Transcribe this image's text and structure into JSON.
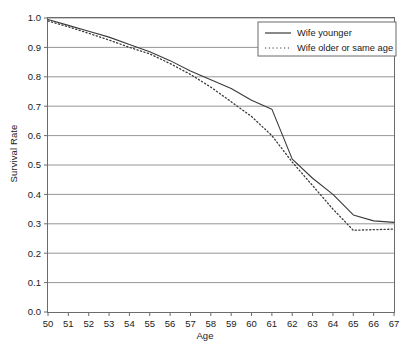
{
  "chart_data": {
    "type": "line",
    "title": "",
    "xlabel": "Age",
    "ylabel": "Survival Rate",
    "xlim": [
      50,
      67
    ],
    "ylim": [
      0.0,
      1.0
    ],
    "grid": true,
    "grid_axis": "y",
    "legend_position": "top-right",
    "x_ticks": [
      50,
      51,
      52,
      53,
      54,
      55,
      56,
      57,
      58,
      59,
      60,
      61,
      62,
      63,
      64,
      65,
      66,
      67
    ],
    "x_tick_labels": [
      "50",
      "51",
      "52",
      "53",
      "54",
      "55",
      "56",
      "57",
      "58",
      "59",
      "60",
      "61",
      "62",
      "63",
      "64",
      "65",
      "66",
      "67"
    ],
    "y_ticks": [
      0.0,
      0.1,
      0.2,
      0.3,
      0.4,
      0.5,
      0.6,
      0.7,
      0.8,
      0.9,
      1.0
    ],
    "y_tick_labels": [
      "0.0",
      "0.1",
      "0.2",
      "0.3",
      "0.4",
      "0.5",
      "0.6",
      "0.7",
      "0.8",
      "0.9",
      "1.0"
    ],
    "x": [
      50,
      51,
      52,
      53,
      54,
      55,
      56,
      57,
      58,
      59,
      60,
      61,
      62,
      63,
      64,
      65,
      66,
      67
    ],
    "series": [
      {
        "name": "Wife younger",
        "style": "solid",
        "color": "#3a3a3a",
        "values": [
          0.995,
          0.975,
          0.955,
          0.935,
          0.91,
          0.885,
          0.855,
          0.82,
          0.79,
          0.76,
          0.72,
          0.69,
          0.52,
          0.455,
          0.4,
          0.33,
          0.31,
          0.305
        ]
      },
      {
        "name": "Wife older or same age",
        "style": "dotted",
        "color": "#3a3a3a",
        "values": [
          0.99,
          0.97,
          0.948,
          0.925,
          0.9,
          0.878,
          0.845,
          0.808,
          0.765,
          0.715,
          0.665,
          0.6,
          0.51,
          0.43,
          0.35,
          0.278,
          0.28,
          0.282
        ]
      }
    ]
  },
  "legend": {
    "entries": [
      {
        "label": "Wife younger",
        "style": "solid"
      },
      {
        "label": "Wife older or same age",
        "style": "dotted"
      }
    ]
  }
}
